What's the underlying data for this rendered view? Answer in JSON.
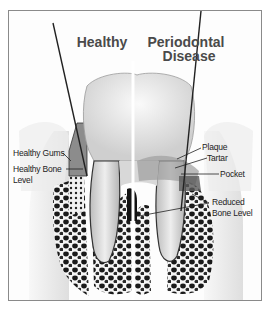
{
  "diagram": {
    "titles": {
      "healthy": "Healthy",
      "disease_line1": "Periodontal",
      "disease_line2": "Disease"
    },
    "labels_left": {
      "healthy_gums": "Healthy Gums",
      "healthy_bone_line1": "Healthy Bone",
      "healthy_bone_line2": "Level"
    },
    "labels_right": {
      "plaque": "Plaque",
      "tartar": "Tartar",
      "pocket": "Pocket",
      "reduced_bone_line1": "Reduced",
      "reduced_bone_line2": "Bone Level"
    },
    "colors": {
      "border": "#8a8a8a",
      "title_text": "#4a4a4a",
      "gum_healthy": "#8c8c8c",
      "tooth": "#e8e8e8",
      "bone_dark": "#1a1a1a",
      "probe": "#222222"
    }
  }
}
